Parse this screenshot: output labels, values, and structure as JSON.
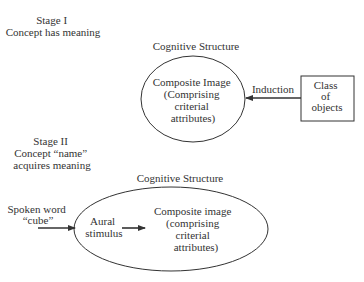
{
  "stage1": {
    "title_lines": [
      "Stage I",
      "Concept has meaning"
    ],
    "structure_label": "Cognitive Structure",
    "ellipse_text_lines": [
      "Composite Image",
      "(Comprising",
      "criterial",
      "attributes)"
    ],
    "arrow_label": "Induction",
    "box_text_lines": [
      "Class",
      "of",
      "objects"
    ]
  },
  "stage2": {
    "title_lines": [
      "Stage II",
      "Concept “name”",
      "acquires meaning"
    ],
    "structure_label": "Cognitive Structure",
    "input_label_lines": [
      "Spoken word",
      "“cube”"
    ],
    "inner_label_lines": [
      "Aural",
      "stimulus"
    ],
    "ellipse_text_lines": [
      "Composite image",
      "(comprising",
      "criterial",
      "attributes)"
    ]
  },
  "colors": {
    "line": "#333333",
    "text": "#333333"
  }
}
